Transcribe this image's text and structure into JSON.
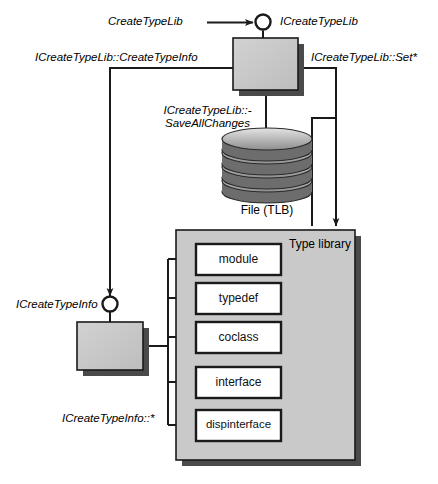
{
  "diagram": {
    "colors": {
      "box_fill": "#c6c6c6",
      "box_stroke": "#1a1a1a",
      "shadow": "#4a4a4a",
      "library_fill": "#c9c9c9",
      "element_fill": "#ffffff",
      "line": "#1a1a1a",
      "text": "#000000",
      "background": "#ffffff"
    },
    "labels": {
      "create_type_lib": "CreateTypeLib",
      "i_create_type_lib": "ICreateTypeLib",
      "i_create_type_lib_create_type_info": "ICreateTypeLib::CreateTypeInfo",
      "i_create_type_lib_set": "ICreateTypeLib::Set*",
      "i_create_type_lib_save_line1": "ICreateTypeLib::-",
      "i_create_type_lib_save_line2": "SaveAllChanges",
      "file_tlb": "File (TLB)",
      "type_library": "Type library",
      "i_create_type_info": "ICreateTypeInfo",
      "i_create_type_info_star": "ICreateTypeInfo::*"
    },
    "nodes": {
      "type_lib_object": {
        "name": "type-lib-object-box"
      },
      "type_info_object": {
        "name": "type-info-object-box"
      },
      "tlb_file": {
        "name": "tlb-file-cylinder"
      },
      "type_library_container": {
        "name": "type-library-container"
      }
    },
    "type_library_elements": [
      {
        "label": "module"
      },
      {
        "label": "typedef"
      },
      {
        "label": "coclass"
      },
      {
        "label": "interface"
      },
      {
        "label": "dispinterface"
      }
    ]
  }
}
